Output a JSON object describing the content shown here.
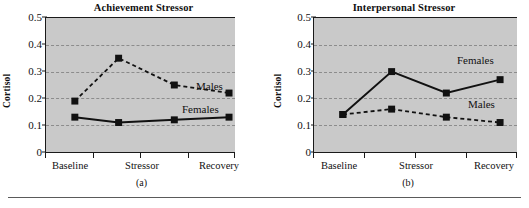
{
  "figure": {
    "background_color": "#ffffff",
    "plot_background_color": "#c9c9c9",
    "line_color": "#111111",
    "grid_color": "#8c8c8c",
    "bottom_rule": true
  },
  "chart_data": [
    {
      "type": "line",
      "panel": "a",
      "title": "Achievement Stressor",
      "caption": "(a)",
      "xlabel": "",
      "ylabel": "Cortisol",
      "categories": [
        "Baseline",
        "",
        "Stressor",
        "",
        "Recovery"
      ],
      "tick_labels": [
        "Baseline",
        "Stressor",
        "Recovery"
      ],
      "x": [
        1,
        2,
        3,
        4
      ],
      "ylim": [
        0,
        0.5
      ],
      "yticks": [
        0,
        0.1,
        0.2,
        0.3,
        0.4,
        0.5
      ],
      "ytick_labels": [
        "0",
        "0.1",
        "0.2",
        "0.3",
        "0.4",
        "0.5"
      ],
      "grid": true,
      "grid_axis": "y",
      "legend": "inline-annotation",
      "series": [
        {
          "name": "Males",
          "style": "dashed",
          "marker": "square",
          "values": [
            0.19,
            0.35,
            0.25,
            0.22
          ],
          "annotation": "Males"
        },
        {
          "name": "Females",
          "style": "solid",
          "marker": "square",
          "values": [
            0.13,
            0.11,
            0.12,
            0.13
          ],
          "annotation": "Females"
        }
      ]
    },
    {
      "type": "line",
      "panel": "b",
      "title": "Interpersonal Stressor",
      "caption": "(b)",
      "xlabel": "",
      "ylabel": "Cortisol",
      "categories": [
        "Baseline",
        "",
        "Stressor",
        "",
        "Recovery"
      ],
      "tick_labels": [
        "Baseline",
        "Stressor",
        "Recovery"
      ],
      "x": [
        1,
        2,
        3,
        4
      ],
      "ylim": [
        0,
        0.5
      ],
      "yticks": [
        0,
        0.1,
        0.2,
        0.3,
        0.4,
        0.5
      ],
      "ytick_labels": [
        "0",
        "0.1",
        "0.2",
        "0.3",
        "0.4",
        "0.5"
      ],
      "grid": true,
      "grid_axis": "y",
      "legend": "inline-annotation",
      "series": [
        {
          "name": "Females",
          "style": "solid",
          "marker": "square",
          "values": [
            0.14,
            0.3,
            0.22,
            0.27
          ],
          "annotation": "Females"
        },
        {
          "name": "Males",
          "style": "dashed",
          "marker": "square",
          "values": [
            0.14,
            0.16,
            0.13,
            0.11
          ],
          "annotation": "Males"
        }
      ]
    }
  ]
}
